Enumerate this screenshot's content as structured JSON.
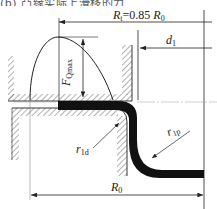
{
  "caption": {
    "text": "(b)  凸缘实际上滑移的力"
  },
  "diagram": {
    "labels": {
      "rt": {
        "main": "R",
        "sub": "t",
        "eq": "=0.85 ",
        "ref": "R",
        "ref_sub": "0"
      },
      "d1": {
        "main": "d",
        "sub": "1"
      },
      "fq": {
        "main": "F",
        "sub": "Qmax"
      },
      "r1d": {
        "main": "r",
        "sub": "1d"
      },
      "r1p": {
        "main": "r",
        "sub": "1p"
      },
      "r0": {
        "main": "R",
        "sub": "0"
      }
    },
    "colors": {
      "line": "#2a2a2a",
      "sheet": "#111111",
      "hatch": "#555555",
      "background": "#ffffff"
    }
  }
}
